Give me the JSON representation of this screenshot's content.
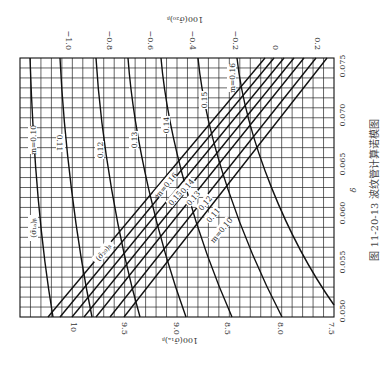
{
  "chart_data": {
    "type": "line",
    "title": "波纹管计算诺模图",
    "caption": "图 11-20-13  波纹管计算诺模图",
    "figure_number": "图 11-20-13",
    "orientation": "rotated 90° clockwise",
    "xlabel": "δ",
    "top_axis_label": "100(σ̄₂₀)ᵦ",
    "bottom_axis_label": "100(σ̄₁ₐ)ᵦ",
    "delta_ticks": [
      "0.050",
      "0.055",
      "0.060",
      "0.065",
      "0.070",
      "0.075"
    ],
    "top_ticks": [
      "−1.0",
      "−0.8",
      "−0.6",
      "−0.4",
      "−0.2",
      "0",
      "0.2"
    ],
    "bottom_ticks": [
      "10",
      "9.5",
      "9.0",
      "8.5",
      "8.0",
      "7.5"
    ],
    "grid": true,
    "curve_families": [
      {
        "name": "(σ̄₁ₐ)ᵦ",
        "label": "(σ̄₁ₐ)ᵦ",
        "curves": [
          "m=0.10",
          "0.11",
          "0.12",
          "0.13",
          "0.14",
          "0.15",
          "m=0.16"
        ]
      },
      {
        "name": "(σ̄₂₀)ᵦ",
        "label": "(σ̄₂₀)ᵦ",
        "curves": [
          "m=0.16",
          "0.15",
          "0.14",
          "0.13",
          "0.12",
          "0.11",
          "m=0.10"
        ]
      }
    ]
  },
  "labels": {
    "top_axis": "100(σ̄₂₀)ᵦ",
    "bottom_axis": "100(σ̄₁ₐ)ᵦ",
    "delta": "δ",
    "caption": "图 11-20-13  波纹管计算诺模图",
    "family1": "(σ̄₁ₐ)ᵦ",
    "family2": "(σ̄₂₀)ᵦ",
    "c1": [
      "m=0.10",
      "0.11",
      "0.12",
      "0.13",
      "0.14",
      "0.15",
      "m=0.16"
    ],
    "c2": [
      "m=0.16",
      "0.15",
      "0.14",
      "0.13",
      "0.12",
      "0.11",
      "m=0.10"
    ],
    "top_ticks": [
      "−1.0",
      "−0.8",
      "−0.6",
      "−0.4",
      "−0.2",
      "0",
      "0.2"
    ],
    "bottom_ticks": [
      "10",
      "9.5",
      "9.0",
      "8.5",
      "8.0",
      "7.5"
    ],
    "delta_ticks": [
      "0.050",
      "0.055",
      "0.060",
      "0.065",
      "0.070",
      "0.075"
    ]
  },
  "colors": {
    "ink": "#111111",
    "grid": "#222222",
    "text": "#333333"
  }
}
